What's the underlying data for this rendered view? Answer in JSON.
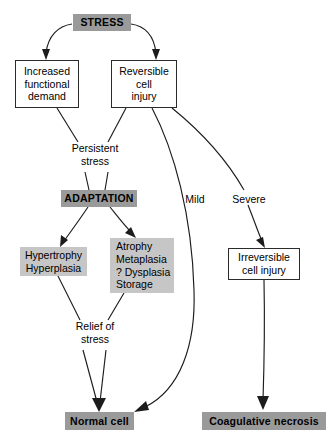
{
  "diagram": {
    "colors": {
      "accent_dark": "#9a9a9a",
      "accent_light": "#c6c6c6",
      "stroke": "#1c1c1c",
      "background": "#ffffff"
    },
    "nodes": [
      {
        "id": "stress",
        "label": "STRESS",
        "lines": [
          "STRESS"
        ],
        "style": "gray-dark"
      },
      {
        "id": "increased-functional-demand",
        "label": "Increased functional demand",
        "lines": [
          "Increased",
          "functional",
          "demand"
        ],
        "style": "white"
      },
      {
        "id": "reversible-cell-injury",
        "label": "Reversible cell injury",
        "lines": [
          "Reversible",
          "cell",
          "injury"
        ],
        "style": "white"
      },
      {
        "id": "adaptation",
        "label": "ADAPTATION",
        "lines": [
          "ADAPTATION"
        ],
        "style": "gray-dark"
      },
      {
        "id": "hypertrophy-hyperplasia",
        "label": "Hypertrophy Hyperplasia",
        "lines": [
          "Hypertrophy",
          "Hyperplasia"
        ],
        "style": "gray-light"
      },
      {
        "id": "atrophy-metaplasia",
        "label": "Atrophy Metaplasia ? Dysplasia Storage",
        "lines": [
          "Atrophy",
          "Metaplasia",
          "? Dysplasia",
          "Storage"
        ],
        "style": "gray-light"
      },
      {
        "id": "irreversible-cell-injury",
        "label": "Irreversible cell injury",
        "lines": [
          "Irreversible",
          "cell injury"
        ],
        "style": "white"
      },
      {
        "id": "normal-cell",
        "label": "Normal cell",
        "lines": [
          "Normal cell"
        ],
        "style": "gray-dark"
      },
      {
        "id": "coagulative-necrosis",
        "label": "Coagulative necrosis",
        "lines": [
          "Coagulative necrosis"
        ],
        "style": "gray-dark"
      }
    ],
    "edge_labels": [
      {
        "id": "persistent-stress",
        "label": "Persistent stress",
        "lines": [
          "Persistent",
          "stress"
        ]
      },
      {
        "id": "mild",
        "label": "Mild",
        "lines": [
          "Mild"
        ]
      },
      {
        "id": "severe",
        "label": "Severe",
        "lines": [
          "Severe"
        ]
      },
      {
        "id": "relief-of-stress",
        "label": "Relief of stress",
        "lines": [
          "Relief of",
          "stress"
        ]
      }
    ]
  }
}
